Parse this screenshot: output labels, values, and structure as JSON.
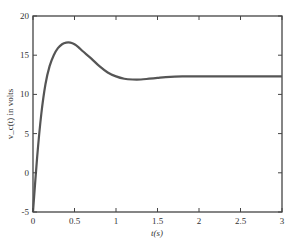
{
  "chart_data": {
    "type": "line",
    "title": "",
    "xlabel": "t(s)",
    "ylabel": "v_c(t) in volts",
    "xlim": [
      0,
      3
    ],
    "ylim": [
      -5,
      20
    ],
    "xticks": [
      0,
      0.5,
      1,
      1.5,
      2,
      2.5,
      3
    ],
    "xtick_labels": [
      "0",
      "0.5",
      "1",
      "1.5",
      "2",
      "2.5",
      "3"
    ],
    "yticks": [
      -5,
      0,
      5,
      10,
      15,
      20
    ],
    "ytick_labels": [
      "-5",
      "0",
      "5",
      "10",
      "15",
      "20"
    ],
    "grid": false,
    "legend": null,
    "series": [
      {
        "name": "v_c(t)",
        "color": "#555555",
        "x": [
          0,
          0.05,
          0.1,
          0.15,
          0.2,
          0.25,
          0.3,
          0.35,
          0.4,
          0.45,
          0.5,
          0.55,
          0.6,
          0.7,
          0.8,
          0.9,
          1.0,
          1.1,
          1.2,
          1.3,
          1.4,
          1.5,
          1.6,
          1.8,
          2.0,
          2.2,
          2.5,
          2.8,
          3.0
        ],
        "y": [
          -5,
          2.0,
          7.5,
          11.3,
          13.6,
          15.0,
          15.9,
          16.4,
          16.6,
          16.6,
          16.4,
          16.0,
          15.5,
          14.6,
          13.6,
          12.8,
          12.3,
          12.0,
          11.9,
          11.9,
          12.0,
          12.1,
          12.2,
          12.3,
          12.3,
          12.3,
          12.3,
          12.3,
          12.3
        ]
      }
    ]
  }
}
